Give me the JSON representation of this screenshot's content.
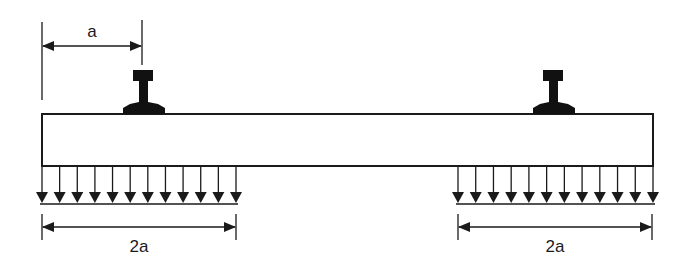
{
  "diagram": {
    "type": "beam-loading",
    "colors": {
      "ink": "#1a1a1a",
      "background": "#ffffff"
    },
    "beam": {
      "x": 42,
      "y": 114,
      "width": 611,
      "height": 52
    },
    "rails": [
      {
        "id": "rail-left",
        "cx": 143
      },
      {
        "id": "rail-right",
        "cx": 553
      }
    ],
    "loads": [
      {
        "id": "load-left",
        "x_start": 42,
        "x_end": 236,
        "arrow_count": 12
      },
      {
        "id": "load-right",
        "x_start": 458,
        "x_end": 653,
        "arrow_count": 12
      }
    ],
    "dimensions": {
      "top": {
        "label_prefix": "",
        "label_var": "a",
        "x_start": 42,
        "x_end": 142
      },
      "bottom_left": {
        "label_prefix": "2",
        "label_var": "a",
        "x_start": 42,
        "x_end": 236
      },
      "bottom_right": {
        "label_prefix": "2",
        "label_var": "a",
        "x_start": 458,
        "x_end": 653
      }
    }
  }
}
